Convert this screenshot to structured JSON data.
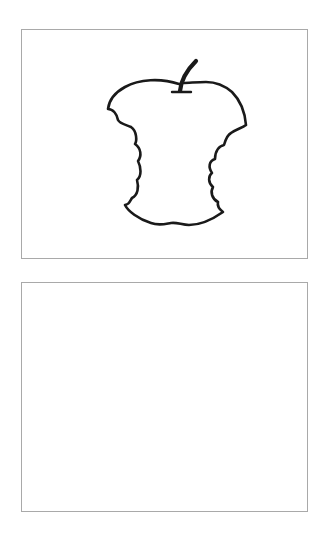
{
  "panels": [
    {
      "id": "top",
      "content": "apple-core-drawing",
      "stroke_color": "#1a1a1a",
      "border_color": "#a9a9a9"
    },
    {
      "id": "bottom",
      "content": "empty",
      "border_color": "#a9a9a9"
    }
  ]
}
